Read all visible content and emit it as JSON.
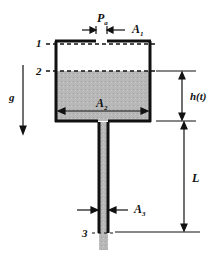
{
  "diagram": {
    "type": "tank-draining-through-pipe",
    "labels": {
      "pressure": "P",
      "pressure_sub": "a",
      "area_top": "A",
      "area_top_sub": "1",
      "area_tank": "A",
      "area_tank_sub": "2",
      "area_pipe": "A",
      "area_pipe_sub": "3",
      "height": "h(t)",
      "length": "L",
      "gravity": "g",
      "station_1": "1",
      "station_2": "2",
      "station_3": "3"
    },
    "colors": {
      "line": "#111111",
      "liquid": "#b4b4b4",
      "background": "#ffffff"
    }
  }
}
